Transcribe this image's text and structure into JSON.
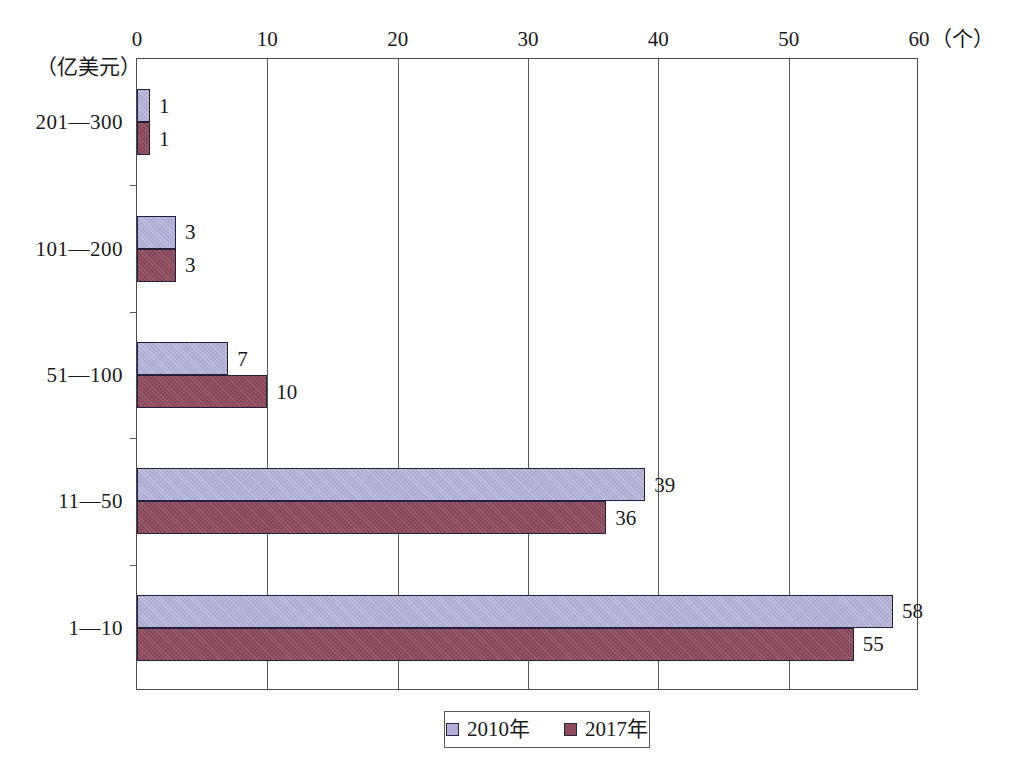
{
  "chart_data": {
    "type": "bar",
    "orientation": "horizontal",
    "title": "",
    "xlabel": "（个）",
    "ylabel": "（亿美元）",
    "xlim": [
      0,
      60
    ],
    "xticks": [
      "0",
      "10",
      "20",
      "30",
      "40",
      "50",
      "60"
    ],
    "grid": true,
    "legend_position": "bottom-center",
    "categories": [
      "201—300",
      "101—200",
      "51—100",
      "11—50",
      "1—10"
    ],
    "series": [
      {
        "name": "2010年",
        "color": "#b2b0d8",
        "values": [
          1,
          3,
          7,
          39,
          58
        ]
      },
      {
        "name": "2017年",
        "color": "#8c4a5c",
        "values": [
          1,
          3,
          10,
          36,
          55
        ]
      }
    ]
  },
  "axes": {
    "y_unit_label": "（亿美元）",
    "x_unit_label": "（个）",
    "x_ticks": [
      {
        "label": "0",
        "value": 0
      },
      {
        "label": "10",
        "value": 10
      },
      {
        "label": "20",
        "value": 20
      },
      {
        "label": "30",
        "value": 30
      },
      {
        "label": "40",
        "value": 40
      },
      {
        "label": "50",
        "value": 50
      },
      {
        "label": "60",
        "value": 60
      }
    ],
    "categories": [
      {
        "label": "201—300"
      },
      {
        "label": "101—200"
      },
      {
        "label": "51—100"
      },
      {
        "label": "11—50"
      },
      {
        "label": "1—10"
      }
    ]
  },
  "bars": [
    {
      "category": "201—300",
      "series": "2010年",
      "value": 1,
      "value_text": "1"
    },
    {
      "category": "201—300",
      "series": "2017年",
      "value": 1,
      "value_text": "1"
    },
    {
      "category": "101—200",
      "series": "2010年",
      "value": 3,
      "value_text": "3"
    },
    {
      "category": "101—200",
      "series": "2017年",
      "value": 3,
      "value_text": "3"
    },
    {
      "category": "51—100",
      "series": "2010年",
      "value": 7,
      "value_text": "7"
    },
    {
      "category": "51—100",
      "series": "2017年",
      "value": 10,
      "value_text": "10"
    },
    {
      "category": "11—50",
      "series": "2010年",
      "value": 39,
      "value_text": "39"
    },
    {
      "category": "11—50",
      "series": "2017年",
      "value": 36,
      "value_text": "36"
    },
    {
      "category": "1—10",
      "series": "2010年",
      "value": 58,
      "value_text": "58"
    },
    {
      "category": "1—10",
      "series": "2017年",
      "value": 55,
      "value_text": "55"
    }
  ],
  "legend": {
    "items": [
      {
        "label": "2010年",
        "color": "#b2b0d8"
      },
      {
        "label": "2017年",
        "color": "#8c4a5c"
      }
    ]
  }
}
